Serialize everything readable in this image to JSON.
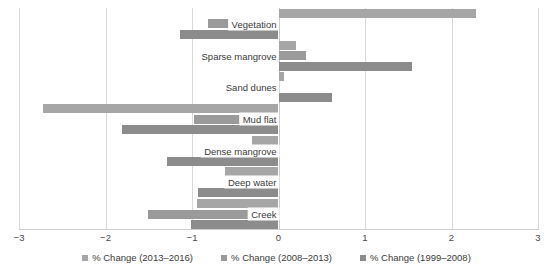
{
  "chart_data": {
    "type": "bar",
    "orientation": "horizontal",
    "title": "",
    "xlabel": "",
    "ylabel": "",
    "xlim": [
      -3,
      3
    ],
    "xticks": [
      -3,
      -2,
      -1,
      0,
      1,
      2,
      3
    ],
    "xticklabels": [
      "−3",
      "−2",
      "−1",
      "0",
      "1",
      "2",
      "3"
    ],
    "grid": true,
    "legend_position": "bottom",
    "categories": [
      "Vegetation",
      "Sparse mangrove",
      "Sand dunes",
      "Mud flat",
      "Dense mangrove",
      "Deep water",
      "Creek"
    ],
    "series": [
      {
        "name": "% Change (2013–2016)",
        "color": "#a6a6a6",
        "values": [
          2.28,
          0.2,
          0.06,
          -2.72,
          -0.31,
          -0.62,
          -0.94
        ]
      },
      {
        "name": "% Change (2008–2013)",
        "color": "#9a9a9a",
        "values": [
          -0.81,
          0.32,
          -0.04,
          -0.98,
          -0.05,
          -0.03,
          -1.51
        ]
      },
      {
        "name": "% Change (1999–2008)",
        "color": "#8c8c8c",
        "values": [
          -1.14,
          1.54,
          0.62,
          -1.81,
          -1.29,
          -0.93,
          -1.01
        ]
      }
    ]
  },
  "legend": {
    "items": [
      {
        "label": "% Change (2013–2016)",
        "color": "#a6a6a6"
      },
      {
        "label": "% Change (2008–2013)",
        "color": "#9a9a9a"
      },
      {
        "label": "% Change (1999–2008)",
        "color": "#8c8c8c"
      }
    ]
  }
}
